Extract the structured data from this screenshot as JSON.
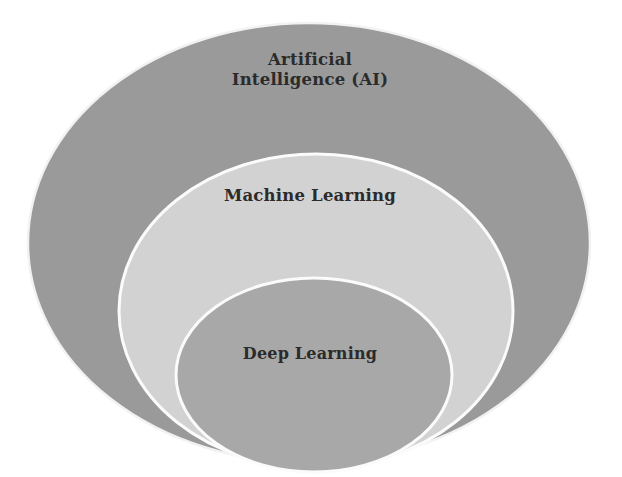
{
  "diagram": {
    "type": "nested-venn",
    "background_color": "#ffffff",
    "text_color": "#2b2b2b",
    "stroke_color": "#f2f2f2",
    "layers": [
      {
        "id": "ai",
        "label": "Artificial\nIntelligence (AI)",
        "label_line_1": "Artificial",
        "label_line_2": "Intelligence (AI)",
        "fill_color": "#9a9a9a",
        "level": 1,
        "cx": 309,
        "cy": 243,
        "rx": 281,
        "ry": 220
      },
      {
        "id": "ml",
        "label": "Machine Learning",
        "fill_color": "#d2d2d2",
        "level": 2,
        "cx": 316,
        "cy": 311,
        "rx": 197,
        "ry": 157
      },
      {
        "id": "dl",
        "label": "Deep Learning",
        "fill_color": "#a8a8a8",
        "level": 3,
        "cx": 314,
        "cy": 375,
        "rx": 138,
        "ry": 97
      }
    ]
  },
  "chart_data": {
    "type": "pie",
    "categories": [
      "Artificial Intelligence (AI)",
      "Machine Learning",
      "Deep Learning"
    ],
    "values": [
      1,
      2,
      3
    ],
    "xlabel": "",
    "ylabel": "",
    "legend_position": "none"
  }
}
